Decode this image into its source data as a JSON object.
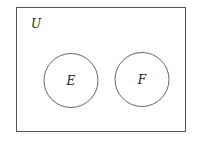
{
  "diagram": {
    "type": "venn",
    "universe": {
      "label": "U"
    },
    "sets": [
      {
        "label": "E"
      },
      {
        "label": "F"
      }
    ],
    "relation": "disjoint",
    "stroke_color": "#555555"
  }
}
